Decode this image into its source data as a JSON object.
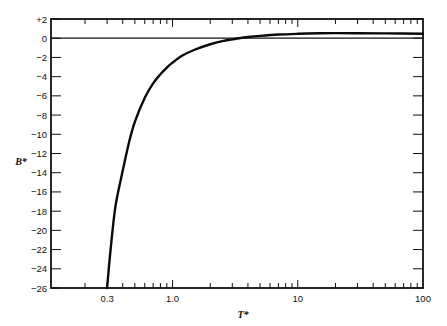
{
  "chart_data": {
    "type": "line",
    "title": "",
    "xlabel": "T*",
    "ylabel": "B*",
    "xscale": "log",
    "xlim": [
      0.107,
      100
    ],
    "ylim": [
      -26,
      2
    ],
    "grid": false,
    "legend": null,
    "x_tick_labels": [
      "0.3",
      "1.0",
      "10",
      "100"
    ],
    "x_major_ticks": [
      0.3,
      1.0,
      10,
      100
    ],
    "y_tick_labels": [
      "+2",
      "0",
      "−2",
      "−4",
      "−6",
      "−8",
      "−10",
      "−12",
      "−14",
      "−16",
      "−18",
      "−20",
      "−22",
      "−24",
      "−26"
    ],
    "y_ticks": [
      2,
      0,
      -2,
      -4,
      -6,
      -8,
      -10,
      -12,
      -14,
      -16,
      -18,
      -20,
      -22,
      -24,
      -26
    ],
    "reference_line": {
      "y": 0
    },
    "series": [
      {
        "name": "B*(T*)",
        "x": [
          0.3,
          0.32,
          0.35,
          0.4,
          0.45,
          0.5,
          0.6,
          0.7,
          0.8,
          0.9,
          1.0,
          1.2,
          1.5,
          2.0,
          2.5,
          3.0,
          3.4,
          4.0,
          5.0,
          7.0,
          10,
          15,
          20,
          30,
          50,
          100
        ],
        "y": [
          -26,
          -22,
          -17.5,
          -13.8,
          -10.8,
          -8.7,
          -6.2,
          -4.7,
          -3.75,
          -3.05,
          -2.54,
          -1.8,
          -1.2,
          -0.63,
          -0.3,
          -0.12,
          0.0,
          0.12,
          0.24,
          0.38,
          0.46,
          0.52,
          0.53,
          0.52,
          0.5,
          0.47
        ]
      }
    ]
  }
}
